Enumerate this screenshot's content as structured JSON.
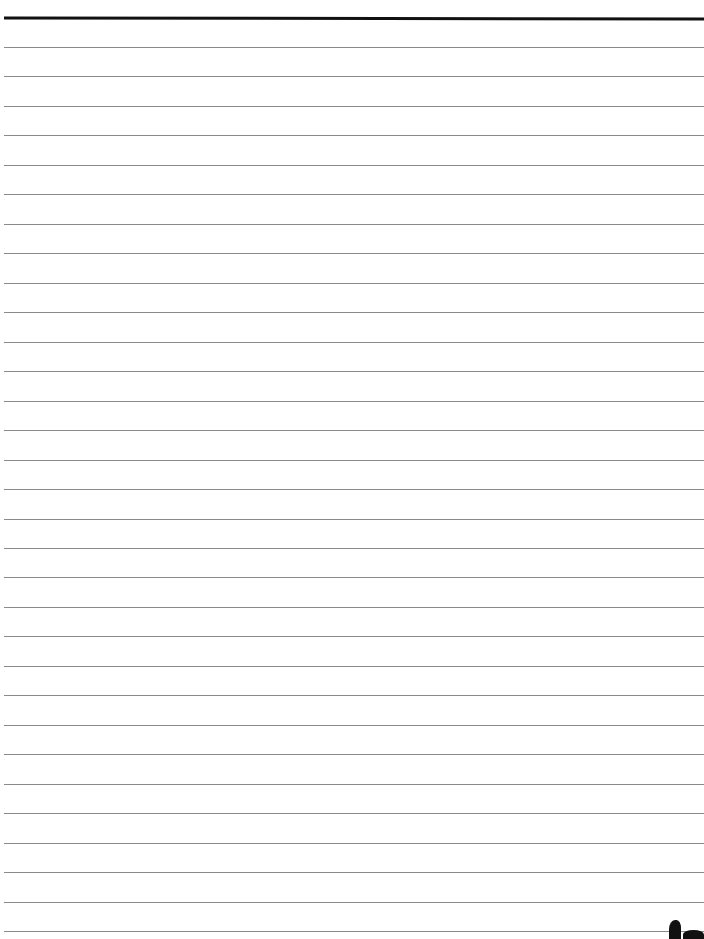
{
  "page": {
    "type": "blank lined paper",
    "ruled_lines": 31,
    "line_spacing_px": 29.47,
    "first_line_y": 47,
    "top_rule_y": 17,
    "colors": {
      "background": "#ffffff",
      "top_rule": "#111111",
      "rule": "#8a8a8a"
    }
  }
}
